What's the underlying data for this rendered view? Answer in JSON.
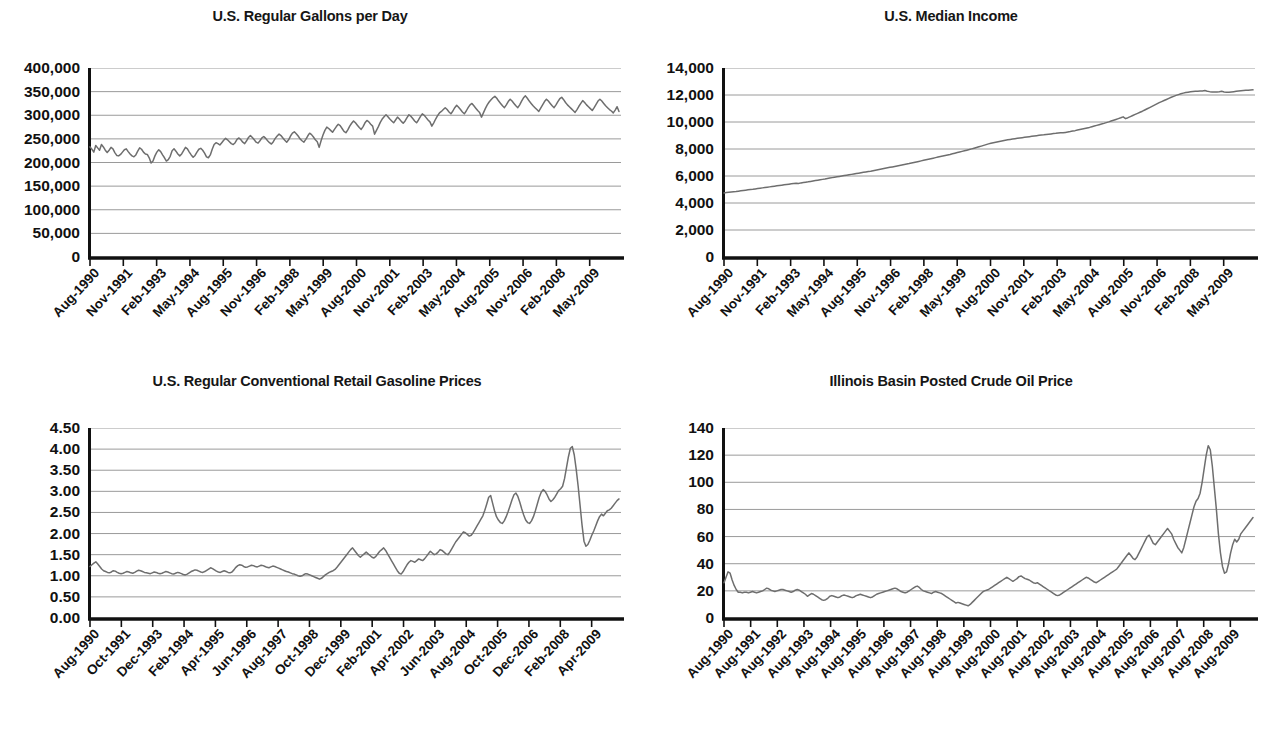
{
  "page": {
    "background": "#ffffff",
    "line_color": "#6e6e6e",
    "grid_color": "#9a9a9a",
    "axis_color": "#111111"
  },
  "chart_data": [
    {
      "id": "us-regular-gallons-per-day",
      "type": "line",
      "title": "U.S. Regular Gallons per Day",
      "xlabel": "",
      "ylabel": "",
      "ylim": [
        0,
        400000
      ],
      "yticks": [
        0,
        50000,
        100000,
        150000,
        200000,
        250000,
        300000,
        350000,
        400000
      ],
      "ytick_labels": [
        "0",
        "50,000",
        "100,000",
        "150,000",
        "200,000",
        "250,000",
        "300,000",
        "350,000",
        "400,000"
      ],
      "grid": true,
      "legend": "none",
      "xtick_labels": [
        "Aug-1990",
        "Nov-1991",
        "Feb-1993",
        "May-1994",
        "Aug-1995",
        "Nov-1996",
        "Feb-1998",
        "May-1999",
        "Aug-2000",
        "Nov-2001",
        "Feb-2003",
        "May-2004",
        "Aug-2005",
        "Nov-2006",
        "Feb-2008",
        "May-2009"
      ],
      "values": [
        233000,
        228000,
        222000,
        236000,
        231000,
        226000,
        238000,
        233000,
        226000,
        221000,
        226000,
        232000,
        229000,
        221000,
        215000,
        214000,
        217000,
        222000,
        227000,
        229000,
        223000,
        218000,
        214000,
        212000,
        216000,
        224000,
        231000,
        228000,
        222000,
        218000,
        217000,
        210000,
        199000,
        203000,
        214000,
        222000,
        227000,
        223000,
        216000,
        210000,
        203000,
        206000,
        213000,
        225000,
        229000,
        224000,
        218000,
        214000,
        218000,
        225000,
        232000,
        229000,
        222000,
        216000,
        211000,
        215000,
        222000,
        228000,
        230000,
        226000,
        220000,
        212000,
        210000,
        216000,
        228000,
        238000,
        242000,
        240000,
        237000,
        242000,
        247000,
        251000,
        248000,
        244000,
        240000,
        238000,
        242000,
        249000,
        252000,
        248000,
        243000,
        240000,
        246000,
        253000,
        257000,
        253000,
        248000,
        243000,
        241000,
        246000,
        252000,
        255000,
        251000,
        246000,
        242000,
        239000,
        244000,
        251000,
        256000,
        260000,
        257000,
        252000,
        247000,
        243000,
        248000,
        256000,
        262000,
        265000,
        261000,
        256000,
        250000,
        246000,
        243000,
        249000,
        256000,
        262000,
        259000,
        254000,
        248000,
        244000,
        232000,
        246000,
        258000,
        268000,
        275000,
        272000,
        268000,
        264000,
        270000,
        276000,
        281000,
        278000,
        272000,
        266000,
        263000,
        269000,
        277000,
        283000,
        288000,
        284000,
        279000,
        274000,
        270000,
        276000,
        284000,
        289000,
        286000,
        281000,
        277000,
        260000,
        268000,
        276000,
        285000,
        292000,
        297000,
        301000,
        297000,
        292000,
        288000,
        284000,
        290000,
        296000,
        292000,
        287000,
        283000,
        288000,
        295000,
        301000,
        298000,
        293000,
        288000,
        284000,
        290000,
        297000,
        303000,
        300000,
        295000,
        290000,
        286000,
        277000,
        284000,
        292000,
        299000,
        305000,
        308000,
        312000,
        316000,
        312000,
        307000,
        303000,
        309000,
        316000,
        321000,
        317000,
        312000,
        307000,
        303000,
        309000,
        316000,
        322000,
        325000,
        320000,
        315000,
        310000,
        306000,
        296000,
        305000,
        314000,
        322000,
        328000,
        333000,
        337000,
        340000,
        336000,
        330000,
        325000,
        320000,
        316000,
        322000,
        329000,
        334000,
        330000,
        325000,
        320000,
        316000,
        322000,
        330000,
        337000,
        341000,
        336000,
        330000,
        325000,
        320000,
        316000,
        312000,
        308000,
        315000,
        322000,
        329000,
        334000,
        330000,
        325000,
        320000,
        316000,
        322000,
        329000,
        335000,
        338000,
        333000,
        327000,
        322000,
        318000,
        314000,
        310000,
        306000,
        312000,
        319000,
        325000,
        331000,
        327000,
        322000,
        318000,
        314000,
        310000,
        316000,
        323000,
        330000,
        334000,
        330000,
        325000,
        320000,
        316000,
        312000,
        309000,
        305000,
        311000,
        318000,
        308000
      ]
    },
    {
      "id": "us-median-income",
      "type": "line",
      "title": "U.S. Median Income",
      "xlabel": "",
      "ylabel": "",
      "ylim": [
        0,
        14000
      ],
      "yticks": [
        0,
        2000,
        4000,
        6000,
        8000,
        10000,
        12000,
        14000
      ],
      "ytick_labels": [
        "0",
        "2,000",
        "4,000",
        "6,000",
        "8,000",
        "10,000",
        "12,000",
        "14,000"
      ],
      "grid": true,
      "legend": "none",
      "xtick_labels": [
        "Aug-1990",
        "Nov-1991",
        "Feb-1993",
        "May-1994",
        "Aug-1995",
        "Nov-1996",
        "Feb-1998",
        "May-1999",
        "Aug-2000",
        "Nov-2001",
        "Feb-2003",
        "May-2004",
        "Aug-2005",
        "Nov-2006",
        "Feb-2008",
        "May-2009"
      ],
      "values": [
        4750,
        4770,
        4790,
        4810,
        4830,
        4850,
        4875,
        4900,
        4925,
        4950,
        4975,
        5000,
        5020,
        5045,
        5070,
        5095,
        5120,
        5145,
        5170,
        5195,
        5220,
        5245,
        5270,
        5295,
        5320,
        5345,
        5370,
        5395,
        5420,
        5445,
        5465,
        5450,
        5490,
        5520,
        5545,
        5570,
        5600,
        5630,
        5660,
        5690,
        5720,
        5750,
        5780,
        5815,
        5850,
        5880,
        5910,
        5940,
        5970,
        6000,
        6030,
        6060,
        6090,
        6120,
        6150,
        6180,
        6210,
        6240,
        6270,
        6300,
        6330,
        6360,
        6395,
        6430,
        6465,
        6500,
        6535,
        6570,
        6605,
        6640,
        6675,
        6710,
        6745,
        6780,
        6815,
        6850,
        6885,
        6920,
        6960,
        7000,
        7040,
        7080,
        7120,
        7160,
        7200,
        7240,
        7280,
        7320,
        7360,
        7400,
        7440,
        7480,
        7520,
        7560,
        7600,
        7645,
        7690,
        7735,
        7780,
        7825,
        7870,
        7915,
        7960,
        8010,
        8060,
        8110,
        8160,
        8215,
        8270,
        8325,
        8380,
        8430,
        8470,
        8505,
        8540,
        8575,
        8610,
        8645,
        8680,
        8710,
        8740,
        8765,
        8790,
        8815,
        8840,
        8865,
        8890,
        8915,
        8940,
        8965,
        8990,
        9010,
        9030,
        9050,
        9075,
        9100,
        9120,
        9140,
        9160,
        9185,
        9210,
        9200,
        9230,
        9260,
        9290,
        9325,
        9360,
        9400,
        9440,
        9480,
        9520,
        9560,
        9600,
        9650,
        9700,
        9750,
        9800,
        9850,
        9900,
        9955,
        10010,
        10070,
        10130,
        10190,
        10250,
        10310,
        10380,
        10250,
        10320,
        10400,
        10480,
        10560,
        10640,
        10720,
        10800,
        10890,
        10980,
        11070,
        11160,
        11250,
        11340,
        11430,
        11510,
        11590,
        11670,
        11750,
        11830,
        11900,
        11970,
        12030,
        12090,
        12140,
        12180,
        12210,
        12235,
        12255,
        12270,
        12280,
        12290,
        12300,
        12330,
        12280,
        12250,
        12230,
        12220,
        12215,
        12240,
        12270,
        12230,
        12200,
        12210,
        12230,
        12250,
        12270,
        12290,
        12310,
        12330,
        12350,
        12360,
        12370,
        12380
      ]
    },
    {
      "id": "us-regular-conventional-retail-gasoline-prices",
      "type": "line",
      "title": "U.S. Regular Conventional Retail Gasoline Prices",
      "xlabel": "",
      "ylabel": "",
      "ylim": [
        0,
        4.5
      ],
      "yticks": [
        0,
        0.5,
        1.0,
        1.5,
        2.0,
        2.5,
        3.0,
        3.5,
        4.0,
        4.5
      ],
      "ytick_labels": [
        "0.00",
        "0.50",
        "1.00",
        "1.50",
        "2.00",
        "2.50",
        "3.00",
        "3.50",
        "4.00",
        "4.50"
      ],
      "grid": true,
      "legend": "none",
      "xtick_labels": [
        "Aug-1990",
        "Oct-1991",
        "Dec-1993",
        "Feb-1994",
        "Apr-1995",
        "Jun-1996",
        "Aug-1997",
        "Oct-1998",
        "Dec-1999",
        "Feb-2001",
        "Apr-2002",
        "Jun-2003",
        "Aug-2004",
        "Oct-2005",
        "Dec-2006",
        "Feb-2008",
        "Apr-2009"
      ],
      "values": [
        1.22,
        1.26,
        1.3,
        1.33,
        1.28,
        1.22,
        1.16,
        1.12,
        1.1,
        1.08,
        1.07,
        1.09,
        1.12,
        1.11,
        1.08,
        1.06,
        1.05,
        1.06,
        1.08,
        1.1,
        1.09,
        1.07,
        1.06,
        1.08,
        1.11,
        1.13,
        1.12,
        1.1,
        1.08,
        1.07,
        1.06,
        1.05,
        1.07,
        1.09,
        1.08,
        1.06,
        1.05,
        1.06,
        1.08,
        1.1,
        1.09,
        1.07,
        1.05,
        1.04,
        1.06,
        1.08,
        1.07,
        1.05,
        1.03,
        1.02,
        1.04,
        1.07,
        1.1,
        1.12,
        1.14,
        1.13,
        1.11,
        1.09,
        1.08,
        1.1,
        1.13,
        1.16,
        1.19,
        1.17,
        1.14,
        1.11,
        1.09,
        1.08,
        1.1,
        1.12,
        1.1,
        1.08,
        1.07,
        1.09,
        1.14,
        1.2,
        1.24,
        1.26,
        1.25,
        1.22,
        1.2,
        1.21,
        1.23,
        1.25,
        1.24,
        1.22,
        1.21,
        1.23,
        1.25,
        1.24,
        1.22,
        1.2,
        1.19,
        1.21,
        1.23,
        1.22,
        1.2,
        1.18,
        1.16,
        1.14,
        1.12,
        1.1,
        1.09,
        1.07,
        1.05,
        1.04,
        1.02,
        1.0,
        0.99,
        1.0,
        1.03,
        1.05,
        1.04,
        1.02,
        1.0,
        0.98,
        0.96,
        0.94,
        0.92,
        0.94,
        0.98,
        1.02,
        1.05,
        1.08,
        1.1,
        1.12,
        1.15,
        1.2,
        1.26,
        1.32,
        1.38,
        1.44,
        1.5,
        1.56,
        1.62,
        1.66,
        1.6,
        1.54,
        1.48,
        1.44,
        1.48,
        1.52,
        1.56,
        1.52,
        1.48,
        1.44,
        1.42,
        1.46,
        1.52,
        1.58,
        1.62,
        1.66,
        1.6,
        1.52,
        1.44,
        1.36,
        1.28,
        1.2,
        1.12,
        1.06,
        1.04,
        1.1,
        1.18,
        1.26,
        1.32,
        1.36,
        1.34,
        1.32,
        1.36,
        1.4,
        1.38,
        1.36,
        1.4,
        1.46,
        1.52,
        1.58,
        1.54,
        1.5,
        1.52,
        1.56,
        1.62,
        1.6,
        1.56,
        1.52,
        1.5,
        1.56,
        1.64,
        1.72,
        1.8,
        1.86,
        1.92,
        1.98,
        2.04,
        2.02,
        1.98,
        1.94,
        1.96,
        2.02,
        2.1,
        2.18,
        2.26,
        2.34,
        2.42,
        2.55,
        2.7,
        2.86,
        2.9,
        2.72,
        2.54,
        2.4,
        2.32,
        2.26,
        2.24,
        2.3,
        2.4,
        2.52,
        2.66,
        2.8,
        2.92,
        2.96,
        2.88,
        2.74,
        2.58,
        2.44,
        2.32,
        2.26,
        2.24,
        2.3,
        2.4,
        2.54,
        2.7,
        2.86,
        2.98,
        3.04,
        3.0,
        2.92,
        2.82,
        2.76,
        2.8,
        2.86,
        2.94,
        3.02,
        3.06,
        3.12,
        3.3,
        3.56,
        3.82,
        4.02,
        4.06,
        3.86,
        3.52,
        3.12,
        2.66,
        2.2,
        1.82,
        1.7,
        1.74,
        1.84,
        1.96,
        2.06,
        2.18,
        2.3,
        2.4,
        2.46,
        2.42,
        2.48,
        2.54,
        2.56,
        2.6,
        2.66,
        2.72,
        2.78,
        2.82
      ]
    },
    {
      "id": "illinois-basin-posted-crude-oil-price",
      "type": "line",
      "title": "Illinois Basin Posted Crude Oil Price",
      "xlabel": "",
      "ylabel": "",
      "ylim": [
        0,
        140
      ],
      "yticks": [
        0,
        20,
        40,
        60,
        80,
        100,
        120,
        140
      ],
      "ytick_labels": [
        "0",
        "20",
        "40",
        "60",
        "80",
        "100",
        "120",
        "140"
      ],
      "grid": true,
      "legend": "none",
      "xtick_labels": [
        "Aug-1990",
        "Aug-1991",
        "Aug-1992",
        "Aug-1993",
        "Aug-1994",
        "Aug-1995",
        "Aug-1996",
        "Aug-1997",
        "Aug-1998",
        "Aug-1999",
        "Aug-2000",
        "Aug-2001",
        "Aug-2002",
        "Aug-2003",
        "Aug-2004",
        "Aug-2005",
        "Aug-2006",
        "Aug-2007",
        "Aug-2008",
        "Aug-2009"
      ],
      "values": [
        26,
        30,
        34,
        33,
        28,
        24,
        21,
        19,
        19,
        18.5,
        19,
        19,
        18.5,
        19,
        19.5,
        19,
        18.5,
        19,
        19.5,
        20,
        21,
        22,
        21.5,
        20.5,
        20,
        19.5,
        20,
        20.5,
        21,
        21,
        20.5,
        20,
        19.5,
        19,
        19.5,
        20.5,
        21,
        20.5,
        19.5,
        18.5,
        17.5,
        16,
        17,
        18,
        17.5,
        16.5,
        15.5,
        14.5,
        13.5,
        13,
        13.5,
        14.5,
        16,
        16.5,
        16,
        15.5,
        15,
        15.5,
        16.5,
        17,
        16.5,
        16,
        15.5,
        15,
        15.5,
        16.5,
        17,
        17.5,
        17,
        16.5,
        16,
        15.5,
        15,
        15.5,
        16.5,
        17.5,
        18,
        18.5,
        19,
        19.5,
        20,
        20.5,
        21,
        21.5,
        22,
        21.5,
        20.5,
        19.5,
        19,
        18.5,
        19,
        20,
        21,
        22,
        23,
        23.5,
        22.5,
        21,
        20,
        19.5,
        19,
        18.5,
        18,
        19,
        19.5,
        19,
        18.5,
        18,
        17,
        16,
        15,
        14,
        13,
        12,
        11,
        11.5,
        11,
        10.5,
        10,
        9.5,
        9,
        10,
        11.5,
        13,
        14.5,
        16,
        17.5,
        19,
        20,
        20.5,
        21,
        22,
        23,
        24,
        25,
        26,
        27,
        28,
        29,
        30,
        29,
        28,
        27,
        28,
        29,
        30.5,
        31,
        30,
        29,
        28.5,
        28,
        27,
        26,
        25.5,
        26,
        25,
        24,
        23,
        22,
        21,
        20,
        19,
        18,
        17,
        16.5,
        17,
        18,
        19,
        20,
        21,
        22,
        23,
        24,
        25,
        26,
        27,
        28,
        29,
        30,
        29.5,
        28.5,
        27.5,
        26.5,
        26,
        27,
        28,
        29,
        30,
        31,
        32,
        33,
        34,
        35,
        36,
        38,
        40,
        42,
        44,
        46,
        48,
        46,
        44,
        43,
        45,
        48,
        51,
        54,
        57,
        60,
        61,
        58,
        55,
        54,
        56,
        58,
        60,
        62,
        64,
        66,
        64,
        62,
        58,
        55,
        52,
        50,
        48,
        52,
        58,
        64,
        70,
        76,
        82,
        86,
        88,
        92,
        100,
        110,
        120,
        127,
        124,
        112,
        96,
        80,
        62,
        48,
        38,
        33,
        34,
        40,
        48,
        54,
        58,
        56,
        58,
        62,
        64,
        66,
        68,
        70,
        72,
        74
      ]
    }
  ]
}
